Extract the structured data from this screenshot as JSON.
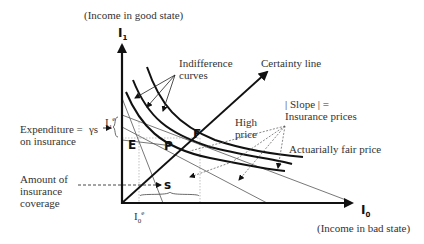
{
  "diagram": {
    "axes": {
      "y_axis": {
        "symbol": "I",
        "subscript": "1",
        "label": "(Income in good state)"
      },
      "x_axis": {
        "symbol": "I",
        "subscript": "0",
        "label": "(Income in bad state)"
      }
    },
    "lines": {
      "certainty_line": "Certainty line"
    },
    "annotations": {
      "indifference_curves": [
        "Indifference",
        "curves"
      ],
      "slope_label": [
        "| Slope | =",
        "Insurance prices"
      ],
      "high_price": [
        "High",
        "price"
      ],
      "actuarially_fair_price": "Actuarially fair price",
      "expenditure": [
        "Expenditure =",
        "on insurance"
      ],
      "expenditure_formula": "γs",
      "amount_coverage": [
        "Amount of",
        "insurance",
        "coverage"
      ]
    },
    "points": {
      "E": "E",
      "F": "F",
      "P": "P",
      "S": "s"
    },
    "ticks": {
      "I1e": {
        "base": "I",
        "sub": "1",
        "sup": "e"
      },
      "I0e": {
        "base": "I",
        "sub": "0",
        "sup": "e"
      }
    },
    "colors": {
      "line": "#111111",
      "thin_line": "#555555",
      "dashed": "#666666",
      "text": "#333333"
    }
  }
}
